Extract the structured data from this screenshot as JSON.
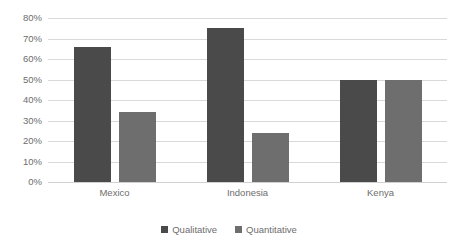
{
  "chart_data": {
    "type": "bar",
    "title": "",
    "subtitle": "",
    "xlabel": "",
    "ylabel": "",
    "categories": [
      "Mexico",
      "Indonesia",
      "Kenya"
    ],
    "series": [
      {
        "name": "Qualitative",
        "color": "#4a4a4a",
        "values": [
          66,
          75,
          50
        ]
      },
      {
        "name": "Quantitative",
        "color": "#6e6e6e",
        "values": [
          34,
          24,
          50
        ]
      }
    ],
    "ylim": [
      0,
      80
    ],
    "y_tick_values": [
      0,
      10,
      20,
      30,
      40,
      50,
      60,
      70,
      80
    ],
    "y_tick_labels": [
      "0%",
      "10%",
      "20%",
      "30%",
      "40%",
      "50%",
      "60%",
      "70%",
      "80%"
    ],
    "y_axis_format": "percent",
    "grid": {
      "horizontal": true,
      "vertical": false,
      "color": "#d9d9d9"
    },
    "legend": {
      "position": "bottom",
      "entries": [
        {
          "label": "Qualitative",
          "color": "#4a4a4a"
        },
        {
          "label": "Quantitative",
          "color": "#6e6e6e"
        }
      ]
    },
    "background_color": "#ffffff",
    "axis_label_color": "#6d6d6d"
  }
}
